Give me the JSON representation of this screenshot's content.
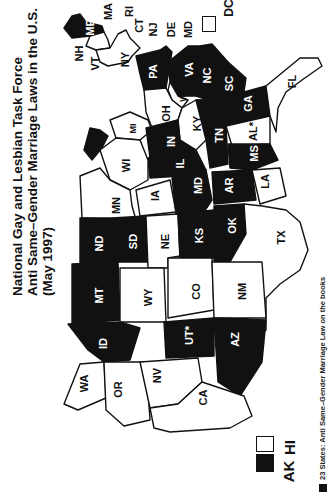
{
  "title": {
    "line1": "National Gay and Lesbian Task Force",
    "line2": "Anti Same–Gender Marriage Laws in the U.S.",
    "line3": "(May 1997)"
  },
  "legend": {
    "text": "23 States: Anti Same–Gender Marriage Law on the books",
    "swatch_color": "#111111"
  },
  "insets": {
    "ak": {
      "label": "AK",
      "fill": "black"
    },
    "hi": {
      "label": "HI",
      "fill": "white"
    },
    "dc": {
      "label": "DC",
      "fill": "white"
    }
  },
  "orientation": "rotated 90deg clockwise (north to the left)",
  "colors": {
    "law": "#111111",
    "no_law": "#ffffff",
    "outline": "#111111"
  },
  "states": [
    {
      "label": "ME",
      "fill": "black"
    },
    {
      "label": "NH",
      "fill": "white"
    },
    {
      "label": "VT",
      "fill": "white"
    },
    {
      "label": "MA",
      "fill": "white"
    },
    {
      "label": "RI",
      "fill": "white"
    },
    {
      "label": "CT",
      "fill": "white"
    },
    {
      "label": "NY",
      "fill": "white"
    },
    {
      "label": "NJ",
      "fill": "white"
    },
    {
      "label": "DE",
      "fill": "white"
    },
    {
      "label": "MD",
      "fill": "white"
    },
    {
      "label": "PA",
      "fill": "black"
    },
    {
      "label": "VA",
      "fill": "black"
    },
    {
      "label": "WV",
      "fill": "white"
    },
    {
      "label": "NC",
      "fill": "black"
    },
    {
      "label": "SC",
      "fill": "black"
    },
    {
      "label": "GA",
      "fill": "black"
    },
    {
      "label": "FL",
      "fill": "white"
    },
    {
      "label": "OH",
      "fill": "white"
    },
    {
      "label": "KY",
      "fill": "white"
    },
    {
      "label": "TN",
      "fill": "black"
    },
    {
      "label": "AL*",
      "fill": "white"
    },
    {
      "label": "MS",
      "fill": "black"
    },
    {
      "label": "MI",
      "fill": "white"
    },
    {
      "label": "IN",
      "fill": "black"
    },
    {
      "label": "IL",
      "fill": "black"
    },
    {
      "label": "WI",
      "fill": "white"
    },
    {
      "label": "MN",
      "fill": "white"
    },
    {
      "label": "IA",
      "fill": "white"
    },
    {
      "label": "MD",
      "fill": "black",
      "note": "label placed on Missouri region"
    },
    {
      "label": "AR",
      "fill": "black"
    },
    {
      "label": "LA",
      "fill": "white"
    },
    {
      "label": "ND",
      "fill": "black"
    },
    {
      "label": "SD",
      "fill": "black"
    },
    {
      "label": "NE",
      "fill": "white"
    },
    {
      "label": "KS",
      "fill": "black"
    },
    {
      "label": "OK",
      "fill": "black"
    },
    {
      "label": "TX",
      "fill": "white"
    },
    {
      "label": "MT",
      "fill": "black"
    },
    {
      "label": "WY",
      "fill": "white"
    },
    {
      "label": "CO",
      "fill": "white"
    },
    {
      "label": "NM",
      "fill": "white"
    },
    {
      "label": "ID",
      "fill": "black"
    },
    {
      "label": "UT*",
      "fill": "black"
    },
    {
      "label": "AZ",
      "fill": "black"
    },
    {
      "label": "WA",
      "fill": "white"
    },
    {
      "label": "OR",
      "fill": "white"
    },
    {
      "label": "NV",
      "fill": "white"
    },
    {
      "label": "CA",
      "fill": "white"
    }
  ]
}
